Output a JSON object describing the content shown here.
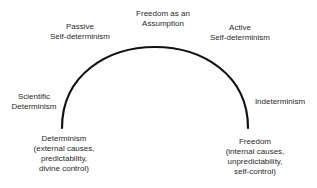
{
  "diagram": {
    "labels": {
      "top": [
        "Freedom as an",
        "Assumption"
      ],
      "upper_left": [
        "Passive",
        "Self-determinism"
      ],
      "upper_right": [
        "Active",
        "Self-determinism"
      ],
      "mid_left": [
        "Scientific",
        "Determinism"
      ],
      "mid_right": [
        "Indeterminism"
      ],
      "bottom_left": [
        "Determinism",
        "(external causes,",
        "predictability,",
        "divine control)"
      ],
      "bottom_right": [
        "Freedom",
        "(internal causes,",
        "unpredictability,",
        "self-control)"
      ]
    },
    "arc": {
      "color": "#111111",
      "stroke_width": 2.2
    }
  }
}
